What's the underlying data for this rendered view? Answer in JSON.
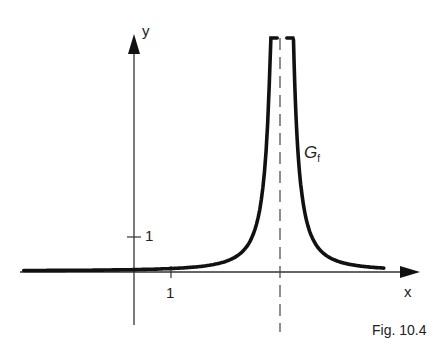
{
  "figure": {
    "caption": "Fig. 10.4",
    "x_axis_label": "x",
    "y_axis_label": "y",
    "x_tick_label": "1",
    "y_tick_label": "1",
    "curve_label": "G",
    "curve_label_sub": "f"
  },
  "chart_data": {
    "type": "line",
    "title": "Fig. 10.4",
    "xlabel": "x",
    "ylabel": "y",
    "curve_name": "G_f",
    "x_ticks": [
      1
    ],
    "y_ticks": [
      1
    ],
    "vertical_asymptote_x": 4,
    "horizontal_asymptote_y": 0,
    "series": [
      {
        "name": "G_f",
        "x": [
          -3,
          -1,
          0,
          1,
          2,
          3,
          3.5,
          3.8,
          4.2,
          4.5,
          5,
          6
        ],
        "y": [
          0.01,
          0.02,
          0.04,
          0.07,
          0.15,
          0.6,
          2.4,
          15,
          15,
          2.4,
          0.6,
          0.15
        ]
      }
    ],
    "xlim": [
      -3.0,
      7.8
    ],
    "ylim": [
      -1.6,
      6.5
    ]
  }
}
